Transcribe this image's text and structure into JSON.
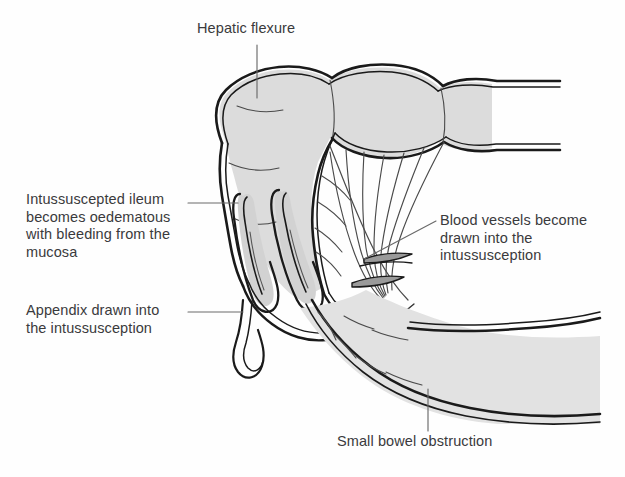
{
  "figure": {
    "domain": "medical-illustration",
    "background_color": "#fefefe",
    "ink_color": "#1a1a1a",
    "label_color": "#3a3a3c",
    "bowel_fill": "#dcdcdc",
    "mesentery_fill": "#ffffff"
  },
  "labels": {
    "hepatic_flexure": "Hepatic flexure",
    "intussuscepted_ileum": "Intussuscepted ileum\nbecomes oedematous\nwith bleeding from the\nmucosa",
    "appendix": "Appendix drawn into\nthe intussusception",
    "blood_vessels": "Blood vessels become\ndrawn into the\nintussusception",
    "small_bowel_obstruction": "Small bowel obstruction"
  },
  "leader_lines": {
    "hepatic_flexure": "vertical line from label down to colon apex",
    "intussuscepted_ileum": "horizontal line from label right to ileum loop",
    "appendix": "horizontal line from label right to appendix",
    "blood_vessels": "diagonal line from label down-left to mesenteric vessels",
    "small_bowel_obstruction": "vertical line from label up to small bowel"
  },
  "structures": [
    {
      "name": "colon-hepatic-flexure",
      "description": "Shaded haustrated large bowel forming the intussuscipiens"
    },
    {
      "name": "intussusceptum-ileum",
      "description": "Two telescoped U-shaped loops of ileum inside the colon"
    },
    {
      "name": "mesentery",
      "description": "Fan of radiating mesenteric blood vessels drawn into the intussusception"
    },
    {
      "name": "appendix",
      "description": "Thin blind-ending tube drawn into the intussusception"
    },
    {
      "name": "small-bowel",
      "description": "Distended obstructed small bowel loop running to lower right"
    }
  ]
}
